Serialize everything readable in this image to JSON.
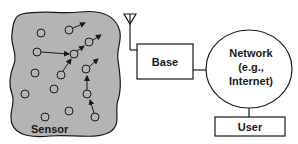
{
  "diagram": {
    "sensor_field": {
      "label": "Sensor",
      "fill": "#b4b4b4"
    },
    "base": {
      "label": "Base"
    },
    "network": {
      "line1": "Network",
      "line2": "(e.g.,",
      "line3": "Internet)"
    },
    "user": {
      "label": "User"
    },
    "nodes": [
      {
        "x": 41,
        "y": 33
      },
      {
        "x": 69,
        "y": 30
      },
      {
        "x": 37,
        "y": 52
      },
      {
        "x": 74,
        "y": 54
      },
      {
        "x": 89,
        "y": 42
      },
      {
        "x": 35,
        "y": 73
      },
      {
        "x": 61,
        "y": 62
      },
      {
        "x": 86,
        "y": 68
      },
      {
        "x": 54,
        "y": 88
      },
      {
        "x": 25,
        "y": 94
      },
      {
        "x": 87,
        "y": 93
      },
      {
        "x": 69,
        "y": 111
      },
      {
        "x": 45,
        "y": 117
      },
      {
        "x": 95,
        "y": 117
      }
    ],
    "colors": {
      "stroke": "#1a1a1a",
      "background": "#ffffff"
    }
  }
}
